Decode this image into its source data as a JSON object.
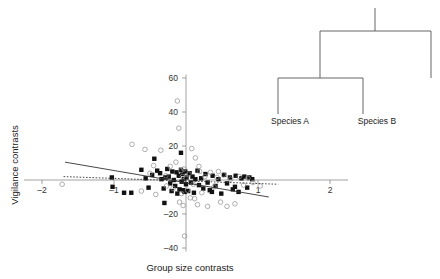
{
  "figure": {
    "background_color": "#ffffff",
    "axis_color": "#8c8c8c",
    "marker_filled_color": "#111111",
    "marker_open_color": "#8c8c8c",
    "line_color": "#333333",
    "tree_color": "#555555"
  },
  "chart_data": {
    "type": "scatter",
    "title": "",
    "xlabel": "Group size contrasts",
    "ylabel": "Vigilance contrasts",
    "xlim": [
      -2.25,
      2.25
    ],
    "ylim": [
      -42,
      62
    ],
    "xticks": [
      -2,
      -1,
      1,
      2
    ],
    "xtick_labels": [
      "–2",
      "–1",
      "1",
      "2"
    ],
    "yticks": [
      60,
      40,
      20,
      -20,
      -40
    ],
    "ytick_labels": [
      "60",
      "40",
      "20",
      "–20",
      "–40"
    ],
    "grid": false,
    "legend": "none",
    "series": [
      {
        "name": "filled-squares",
        "marker": "filled-square",
        "color": "#111111",
        "points": [
          [
            -1.03,
            1.5
          ],
          [
            -1.02,
            -4.0
          ],
          [
            -0.86,
            -7.5
          ],
          [
            -0.76,
            -7.5
          ],
          [
            -0.62,
            6.0
          ],
          [
            -0.56,
            1.0
          ],
          [
            -0.52,
            -4.5
          ],
          [
            -0.47,
            3.0
          ],
          [
            -0.44,
            12.5
          ],
          [
            -0.4,
            5.5
          ],
          [
            -0.36,
            4.0
          ],
          [
            -0.34,
            0.5
          ],
          [
            -0.31,
            -5.0
          ],
          [
            -0.29,
            1.5
          ],
          [
            -0.26,
            6.5
          ],
          [
            -0.24,
            2.0
          ],
          [
            -0.22,
            -2.0
          ],
          [
            -0.2,
            -6.5
          ],
          [
            -0.19,
            5.0
          ],
          [
            -0.17,
            0.0
          ],
          [
            -0.15,
            -3.5
          ],
          [
            -0.13,
            4.5
          ],
          [
            -0.12,
            -8.0
          ],
          [
            -0.1,
            2.5
          ],
          [
            -0.09,
            -5.5
          ],
          [
            -0.07,
            6.0
          ],
          [
            -0.06,
            -1.0
          ],
          [
            -0.05,
            3.5
          ],
          [
            -0.04,
            -6.0
          ],
          [
            -0.03,
            0.5
          ],
          [
            -0.02,
            -7.0
          ],
          [
            -0.01,
            5.0
          ],
          [
            0.0,
            -2.5
          ],
          [
            0.01,
            1.5
          ],
          [
            0.03,
            -6.5
          ],
          [
            0.05,
            4.0
          ],
          [
            0.07,
            -1.5
          ],
          [
            0.09,
            2.0
          ],
          [
            0.11,
            -7.5
          ],
          [
            0.13,
            0.5
          ],
          [
            0.16,
            5.5
          ],
          [
            0.18,
            -3.0
          ],
          [
            0.21,
            1.0
          ],
          [
            0.24,
            -5.0
          ],
          [
            0.27,
            3.5
          ],
          [
            0.3,
            -1.5
          ],
          [
            0.33,
            -6.0
          ],
          [
            0.37,
            2.5
          ],
          [
            0.41,
            -3.5
          ],
          [
            0.45,
            0.5
          ],
          [
            0.49,
            -8.0
          ],
          [
            0.53,
            3.0
          ],
          [
            0.57,
            -2.0
          ],
          [
            0.61,
            1.5
          ],
          [
            0.65,
            -5.5
          ],
          [
            0.69,
            2.5
          ],
          [
            0.73,
            -7.0
          ],
          [
            0.77,
            1.0
          ],
          [
            0.81,
            2.0
          ],
          [
            0.85,
            -4.5
          ],
          [
            0.88,
            1.5
          ],
          [
            0.92,
            0.5
          ],
          [
            -0.3,
            -13.5
          ],
          [
            -0.07,
            16.0
          ],
          [
            0.68,
            -4.0
          ],
          [
            0.36,
            -7.0
          ]
        ]
      },
      {
        "name": "open-circles",
        "marker": "open-circle",
        "color": "#8c8c8c",
        "points": [
          [
            -1.72,
            -2.5
          ],
          [
            -0.75,
            21.0
          ],
          [
            -0.57,
            18.0
          ],
          [
            -0.5,
            4.0
          ],
          [
            -0.42,
            -8.5
          ],
          [
            -0.35,
            17.5
          ],
          [
            -0.28,
            2.5
          ],
          [
            -0.27,
            -3.5
          ],
          [
            -0.22,
            8.0
          ],
          [
            -0.18,
            -5.0
          ],
          [
            -0.14,
            10.5
          ],
          [
            -0.12,
            46.5
          ],
          [
            -0.1,
            30.5
          ],
          [
            -0.09,
            -13.0
          ],
          [
            -0.07,
            5.5
          ],
          [
            -0.06,
            -8.0
          ],
          [
            -0.05,
            2.0
          ],
          [
            -0.04,
            -15.0
          ],
          [
            -0.03,
            6.5
          ],
          [
            -0.02,
            -33.0
          ],
          [
            0.0,
            1.0
          ],
          [
            0.02,
            -6.0
          ],
          [
            0.04,
            3.5
          ],
          [
            0.06,
            -10.5
          ],
          [
            0.08,
            18.5
          ],
          [
            0.1,
            -2.5
          ],
          [
            0.13,
            13.0
          ],
          [
            0.16,
            -14.5
          ],
          [
            0.19,
            5.0
          ],
          [
            0.22,
            -7.5
          ],
          [
            0.26,
            2.0
          ],
          [
            0.3,
            -15.5
          ],
          [
            0.34,
            4.5
          ],
          [
            0.39,
            -4.0
          ],
          [
            0.43,
            1.5
          ],
          [
            0.48,
            -13.0
          ],
          [
            0.52,
            3.0
          ],
          [
            0.57,
            -15.5
          ],
          [
            0.62,
            0.5
          ],
          [
            0.68,
            -14.0
          ],
          [
            0.74,
            2.0
          ],
          [
            0.8,
            -3.0
          ],
          [
            0.86,
            1.0
          ],
          [
            0.93,
            -1.5
          ],
          [
            1.03,
            -3.5
          ],
          [
            -0.45,
            8.5
          ],
          [
            0.18,
            8.0
          ],
          [
            0.45,
            5.0
          ],
          [
            -0.62,
            -6.5
          ],
          [
            0.12,
            -11.0
          ]
        ]
      }
    ],
    "trend_lines": [
      {
        "name": "solid-regression-line",
        "style": "solid",
        "color": "#333333",
        "x_start": -1.68,
        "y_start": 10.5,
        "x_end": 1.15,
        "y_end": -10.0
      },
      {
        "name": "dotted-regression-line",
        "style": "dotted",
        "color": "#333333",
        "x_start": -1.7,
        "y_start": 2.0,
        "x_end": 1.28,
        "y_end": -2.5
      }
    ]
  },
  "tree": {
    "name": "phylogenetic-tree",
    "labels": [
      {
        "text": "Species A"
      },
      {
        "text": "Species B"
      }
    ]
  }
}
